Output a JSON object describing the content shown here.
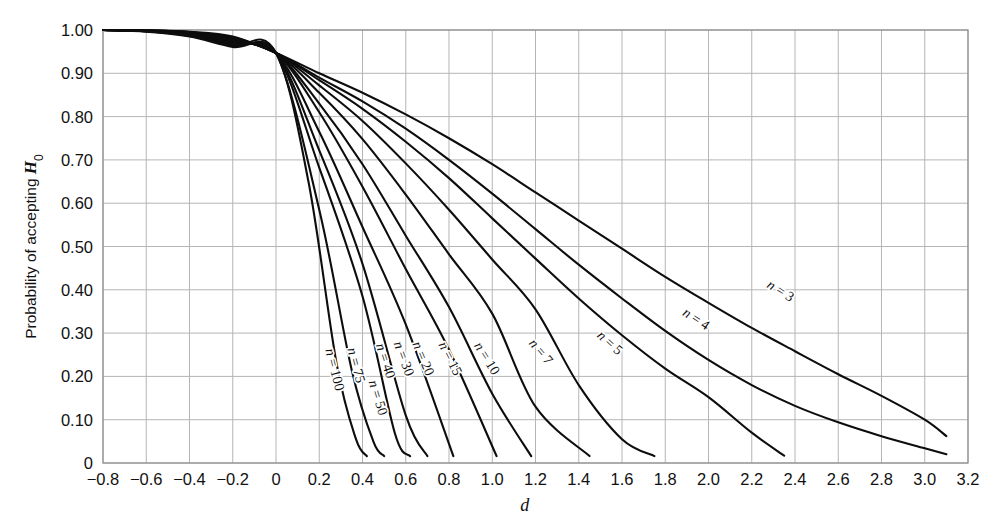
{
  "figure": {
    "background": "#ffffff",
    "grid_color": "#b5b5b5",
    "curve_color": "#0d0d0d",
    "axis_color": "#8e8e8e"
  },
  "axes": {
    "x_title": "d",
    "y_title_prefix": "Probability of accepting ",
    "y_title_symbol": "H",
    "y_title_subscript": "0",
    "x_ticks": [
      "−0.8",
      "−0.6",
      "−0.4",
      "−0.2",
      "0",
      "0.2",
      "0.4",
      "0.6",
      "0.8",
      "1.0",
      "1.2",
      "1.4",
      "1.6",
      "1.8",
      "2.0",
      "2.2",
      "2.4",
      "2.6",
      "2.8",
      "3.0",
      "3.2"
    ],
    "y_ticks": [
      "1.00",
      "0.90",
      "0.80",
      "0.70",
      "0.60",
      "0.50",
      "0.40",
      "0.30",
      "0.20",
      "0.10",
      "0"
    ]
  },
  "chart_data": {
    "type": "line",
    "title": "",
    "subtitle": "",
    "xlabel": "d",
    "ylabel": "Probability of accepting H0",
    "xlim": [
      -0.8,
      3.2
    ],
    "ylim": [
      0.0,
      1.0
    ],
    "x_tick_values": [
      -0.8,
      -0.6,
      -0.4,
      -0.2,
      0,
      0.2,
      0.4,
      0.6,
      0.8,
      1.0,
      1.2,
      1.4,
      1.6,
      1.8,
      2.0,
      2.2,
      2.4,
      2.6,
      2.8,
      3.0,
      3.2
    ],
    "y_tick_values": [
      1.0,
      0.9,
      0.8,
      0.7,
      0.6,
      0.5,
      0.4,
      0.3,
      0.2,
      0.1,
      0
    ],
    "grid": true,
    "legend": "inline-curve-labels",
    "convergence_point": {
      "d": 0.0,
      "probability": 0.947
    },
    "series": [
      {
        "name": "n = 3",
        "n": 3,
        "label": "n = 3",
        "label_rotation_deg": 32,
        "label_pos": {
          "d": 2.33,
          "p": 0.395
        },
        "x": [
          -0.8,
          -0.6,
          -0.4,
          -0.2,
          0,
          0.2,
          0.4,
          0.6,
          0.8,
          1.0,
          1.2,
          1.4,
          1.6,
          1.8,
          2.0,
          2.2,
          2.4,
          2.6,
          2.8,
          3.0,
          3.1
        ],
        "y": [
          1.0,
          0.999,
          0.996,
          0.985,
          0.947,
          0.9,
          0.855,
          0.805,
          0.75,
          0.69,
          0.625,
          0.56,
          0.495,
          0.43,
          0.37,
          0.312,
          0.258,
          0.205,
          0.155,
          0.1,
          0.062
        ]
      },
      {
        "name": "n = 4",
        "n": 4,
        "label": "n = 4",
        "label_rotation_deg": 33,
        "label_pos": {
          "d": 1.94,
          "p": 0.33
        },
        "x": [
          -0.8,
          -0.6,
          -0.4,
          -0.2,
          0,
          0.2,
          0.4,
          0.6,
          0.8,
          1.0,
          1.2,
          1.4,
          1.6,
          1.8,
          2.0,
          2.2,
          2.4,
          2.6,
          2.8,
          3.0,
          3.1
        ],
        "y": [
          1.0,
          0.999,
          0.995,
          0.983,
          0.947,
          0.89,
          0.835,
          0.772,
          0.7,
          0.622,
          0.54,
          0.458,
          0.38,
          0.305,
          0.238,
          0.18,
          0.132,
          0.094,
          0.062,
          0.034,
          0.02
        ]
      },
      {
        "name": "n = 5",
        "n": 5,
        "label": "n = 5",
        "label_rotation_deg": 42,
        "label_pos": {
          "d": 1.54,
          "p": 0.275
        },
        "x": [
          -0.8,
          -0.6,
          -0.4,
          -0.2,
          0,
          0.2,
          0.4,
          0.6,
          0.8,
          1.0,
          1.2,
          1.4,
          1.6,
          1.8,
          2.0,
          2.2,
          2.35
        ],
        "y": [
          1.0,
          0.999,
          0.995,
          0.982,
          0.947,
          0.884,
          0.818,
          0.742,
          0.658,
          0.565,
          0.472,
          0.38,
          0.295,
          0.218,
          0.152,
          0.07,
          0.017
        ]
      },
      {
        "name": "n = 7",
        "n": 7,
        "label": "n = 7",
        "label_rotation_deg": 50,
        "label_pos": {
          "d": 1.22,
          "p": 0.255
        },
        "x": [
          -0.8,
          -0.6,
          -0.4,
          -0.2,
          0,
          0.2,
          0.4,
          0.6,
          0.8,
          1.0,
          1.2,
          1.4,
          1.6,
          1.75
        ],
        "y": [
          1.0,
          0.999,
          0.994,
          0.98,
          0.947,
          0.872,
          0.79,
          0.692,
          0.585,
          0.47,
          0.355,
          0.18,
          0.055,
          0.016
        ]
      },
      {
        "name": "n = 10",
        "n": 10,
        "label": "n = 10",
        "label_rotation_deg": 58,
        "label_pos": {
          "d": 0.97,
          "p": 0.24
        },
        "x": [
          -0.8,
          -0.6,
          -0.4,
          -0.2,
          0,
          0.2,
          0.4,
          0.6,
          0.8,
          1.0,
          1.2,
          1.45
        ],
        "y": [
          1.0,
          0.999,
          0.993,
          0.978,
          0.947,
          0.855,
          0.748,
          0.62,
          0.482,
          0.345,
          0.13,
          0.016
        ]
      },
      {
        "name": "n = 15",
        "n": 15,
        "label": "n = 15",
        "label_rotation_deg": 63,
        "label_pos": {
          "d": 0.8,
          "p": 0.24
        },
        "x": [
          -0.8,
          -0.6,
          -0.4,
          -0.2,
          0,
          0.2,
          0.4,
          0.6,
          0.8,
          1.0,
          1.18
        ],
        "y": [
          1.0,
          0.998,
          0.992,
          0.975,
          0.947,
          0.83,
          0.69,
          0.525,
          0.36,
          0.16,
          0.016
        ]
      },
      {
        "name": "n = 20",
        "n": 20,
        "label": "n = 20",
        "label_rotation_deg": 67,
        "label_pos": {
          "d": 0.675,
          "p": 0.24
        },
        "x": [
          -0.8,
          -0.6,
          -0.4,
          -0.2,
          0,
          0.2,
          0.4,
          0.6,
          0.8,
          1.02
        ],
        "y": [
          1.0,
          0.998,
          0.991,
          0.973,
          0.947,
          0.81,
          0.638,
          0.448,
          0.262,
          0.016
        ]
      },
      {
        "name": "n = 30",
        "n": 30,
        "label": "n = 30",
        "label_rotation_deg": 70,
        "label_pos": {
          "d": 0.585,
          "p": 0.24
        },
        "x": [
          -0.8,
          -0.6,
          -0.4,
          -0.2,
          0,
          0.2,
          0.4,
          0.6,
          0.82
        ],
        "y": [
          1.0,
          0.998,
          0.99,
          0.97,
          0.947,
          0.765,
          0.545,
          0.32,
          0.016
        ]
      },
      {
        "name": "n = 40",
        "n": 40,
        "label": "n = 40",
        "label_rotation_deg": 72,
        "label_pos": {
          "d": 0.5,
          "p": 0.235
        },
        "x": [
          -0.8,
          -0.6,
          -0.4,
          -0.2,
          0,
          0.2,
          0.4,
          0.6,
          0.7
        ],
        "y": [
          1.0,
          0.997,
          0.989,
          0.968,
          0.947,
          0.722,
          0.46,
          0.11,
          0.016
        ]
      },
      {
        "name": "n = 50",
        "n": 50,
        "label": "n = 50",
        "label_rotation_deg": 73,
        "label_pos": {
          "d": 0.465,
          "p": 0.15
        },
        "x": [
          -0.8,
          -0.6,
          -0.4,
          -0.2,
          0,
          0.2,
          0.4,
          0.55,
          0.62
        ],
        "y": [
          1.0,
          0.997,
          0.988,
          0.966,
          0.947,
          0.682,
          0.385,
          0.068,
          0.016
        ]
      },
      {
        "name": "n = 75",
        "n": 75,
        "label": "n = 75",
        "label_rotation_deg": 75,
        "label_pos": {
          "d": 0.365,
          "p": 0.225
        },
        "x": [
          -0.8,
          -0.6,
          -0.4,
          -0.2,
          0,
          0.2,
          0.35,
          0.45,
          0.5
        ],
        "y": [
          1.0,
          0.997,
          0.986,
          0.963,
          0.947,
          0.585,
          0.215,
          0.05,
          0.016
        ]
      },
      {
        "name": "n = 100",
        "n": 100,
        "label": "n = 100",
        "label_rotation_deg": 76,
        "label_pos": {
          "d": 0.265,
          "p": 0.215
        },
        "x": [
          -0.8,
          -0.6,
          -0.4,
          -0.2,
          0,
          0.15,
          0.28,
          0.37,
          0.42
        ],
        "y": [
          1.0,
          0.996,
          0.985,
          0.961,
          0.947,
          0.65,
          0.23,
          0.055,
          0.016
        ]
      }
    ]
  }
}
